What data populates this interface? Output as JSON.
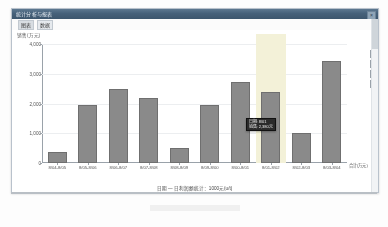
{
  "window": {
    "title": "统计分析与报表",
    "close_label": "×"
  },
  "toolbar": {
    "tabs": [
      {
        "label": "图表"
      },
      {
        "label": "数据"
      }
    ]
  },
  "rail": {
    "items": [
      {
        "name": "pen-icon",
        "glyph": "✎"
      },
      {
        "name": "bar-chart-icon",
        "glyph": "▥"
      },
      {
        "name": "pie-chart-icon",
        "glyph": "◧"
      },
      {
        "name": "table-icon",
        "glyph": "▦"
      },
      {
        "name": "grid-icon",
        "glyph": "▩"
      }
    ]
  },
  "scrollbar": {
    "position": "right"
  },
  "chart_data": {
    "type": "bar",
    "title": "",
    "xlabel": "日期 — 日利润额统计：1000元(u/t)",
    "ylabel": "销售(万元)",
    "y_unit_label": "销售(万元)",
    "x_end_label": "合计(万元)",
    "categories": [
      "8/04-8/05",
      "8/05-8/06",
      "8/06-8/07",
      "8/07-8/08",
      "8/08-8/09",
      "8/09-8/00",
      "8/00-8/01",
      "8/01-8/02",
      "8/02-8/03",
      "8/03-8/04"
    ],
    "values": [
      380,
      1960,
      2480,
      2180,
      520,
      1940,
      2740,
      2380,
      1000,
      3420
    ],
    "ylim": [
      0,
      4000
    ],
    "yticks": [
      0,
      1000,
      2000,
      3000,
      4000
    ],
    "ytick_labels": [
      "0",
      "1,000",
      "2,000",
      "3,000",
      "4,000"
    ],
    "grid": true,
    "legend": "none",
    "bar_color": "#8a8a8a",
    "highlight_color": "#f3f1d8",
    "highlighted_category": "8/01-8/02"
  },
  "tooltip": {
    "line1": "日期: 8/01",
    "line2": "销售: 2,380元"
  }
}
